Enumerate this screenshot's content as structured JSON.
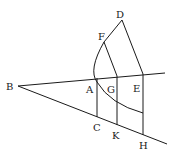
{
  "diagram": {
    "type": "geometric-construction",
    "points": {
      "B": {
        "label": "B",
        "x": 18,
        "y": 86,
        "lx": 6,
        "ly": 90
      },
      "A": {
        "label": "A",
        "x": 97,
        "y": 78,
        "lx": 86,
        "ly": 93
      },
      "G": {
        "label": "G",
        "x": 117,
        "y": 76,
        "lx": 107,
        "ly": 93
      },
      "E": {
        "label": "E",
        "x": 143,
        "y": 74,
        "lx": 133,
        "ly": 92
      },
      "C": {
        "label": "C",
        "x": 97,
        "y": 117,
        "lx": 93,
        "ly": 131
      },
      "K": {
        "label": "K",
        "x": 117,
        "y": 125,
        "lx": 112,
        "ly": 139
      },
      "H": {
        "label": "H",
        "x": 143,
        "y": 135,
        "lx": 139,
        "ly": 149
      },
      "F": {
        "label": "F",
        "x": 104,
        "y": 42,
        "lx": 98,
        "ly": 40
      },
      "D": {
        "label": "D",
        "x": 122,
        "y": 20,
        "lx": 116,
        "ly": 18
      }
    },
    "segments": [
      {
        "from": "B",
        "to": "upper-end",
        "x1": 18,
        "y1": 86,
        "x2": 165,
        "y2": 73
      },
      {
        "from": "B",
        "to": "lower-end",
        "x1": 18,
        "y1": 86,
        "x2": 167,
        "y2": 144
      },
      {
        "from": "A",
        "to": "C"
      },
      {
        "from": "G",
        "to": "K"
      },
      {
        "from": "E",
        "to": "H"
      },
      {
        "from": "F",
        "to": "G"
      },
      {
        "from": "D",
        "to": "E"
      },
      {
        "from": "F",
        "to": "D"
      }
    ],
    "arc": {
      "description": "curve from F through A to point on EH",
      "path": "M104,42 Q88,70 97,82 Q110,104 143,113"
    }
  }
}
